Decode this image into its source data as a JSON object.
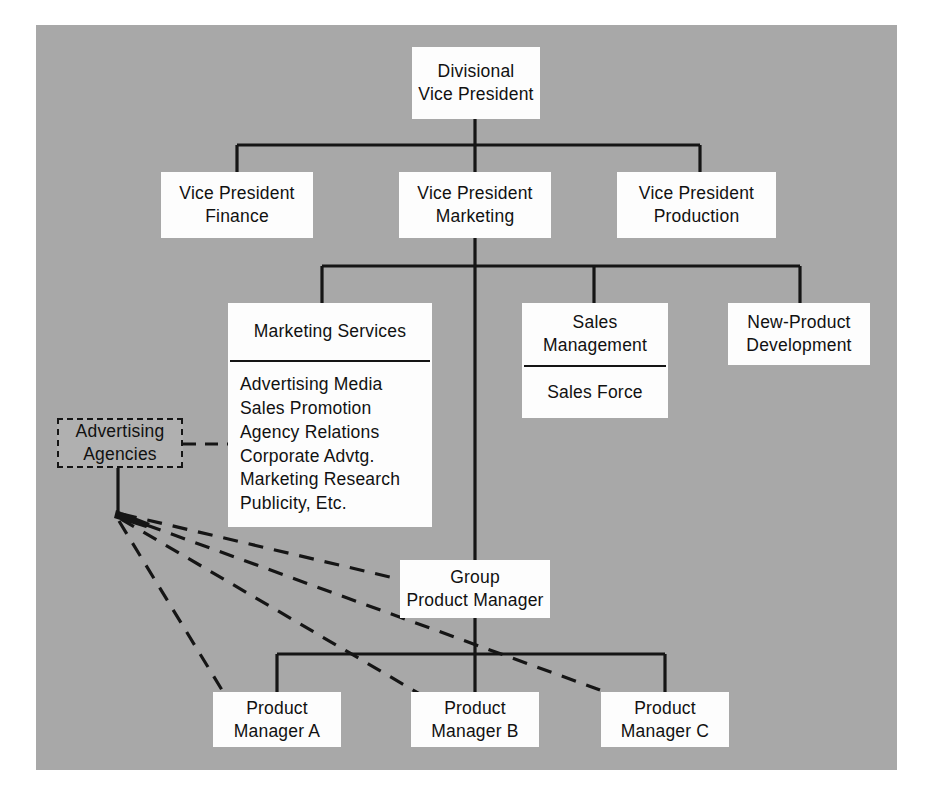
{
  "diagram": {
    "background_color": "#a8a8a8",
    "box_color": "#fdfdfd",
    "line_color": "#151515"
  },
  "nodes": {
    "divisional_vp": {
      "line1": "Divisional",
      "line2": "Vice President"
    },
    "vp_finance": {
      "line1": "Vice President",
      "line2": "Finance"
    },
    "vp_marketing": {
      "line1": "Vice President",
      "line2": "Marketing"
    },
    "vp_production": {
      "line1": "Vice President",
      "line2": "Production"
    },
    "marketing_services": {
      "header": "Marketing Services",
      "items": [
        "Advertising Media",
        "Sales Promotion",
        "Agency Relations",
        "Corporate Advtg.",
        "Marketing Research",
        "Publicity, Etc."
      ]
    },
    "sales_management": {
      "header_line1": "Sales",
      "header_line2": "Management",
      "items": [
        "Sales Force"
      ]
    },
    "new_product_development": {
      "line1": "New-Product",
      "line2": "Development"
    },
    "advertising_agencies": {
      "line1": "Advertising",
      "line2": "Agencies"
    },
    "group_product_manager": {
      "line1": "Group",
      "line2": "Product Manager"
    },
    "product_manager_a": {
      "line1": "Product",
      "line2": "Manager A"
    },
    "product_manager_b": {
      "line1": "Product",
      "line2": "Manager B"
    },
    "product_manager_c": {
      "line1": "Product",
      "line2": "Manager C"
    }
  },
  "connections": {
    "solid": [
      "Divisional Vice President to Vice President Finance",
      "Divisional Vice President to Vice President Marketing",
      "Divisional Vice President to Vice President Production",
      "Vice President Marketing to Marketing Services",
      "Vice President Marketing to Sales Management",
      "Vice President Marketing to New-Product Development",
      "Vice President Marketing to Group Product Manager",
      "Group Product Manager to Product Manager A",
      "Group Product Manager to Product Manager B",
      "Group Product Manager to Product Manager C"
    ],
    "dashed": [
      "Advertising Agencies to Marketing Services",
      "Advertising Agencies to Product Manager A",
      "Advertising Agencies to Product Manager B",
      "Advertising Agencies to Product Manager C"
    ]
  }
}
